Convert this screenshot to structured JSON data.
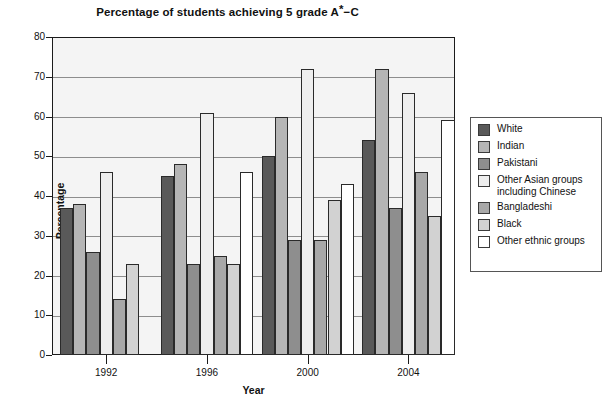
{
  "chart_data": {
    "type": "bar",
    "title": "Percentage of students achieving 5 grade A*−C",
    "title_prefix": "Percentage of students achieving 5 grade A",
    "title_star": "*",
    "title_suffix": "−C",
    "xlabel": "Year",
    "ylabel": "Percentage",
    "categories": [
      "1992",
      "1996",
      "2000",
      "2004"
    ],
    "ylim": [
      0,
      80
    ],
    "yticks": [
      0,
      10,
      20,
      30,
      40,
      50,
      60,
      70,
      80
    ],
    "grid": true,
    "legend_position": "right-outside",
    "series": [
      {
        "name": "White",
        "color": "#595959",
        "values": [
          37,
          45,
          50,
          54
        ]
      },
      {
        "name": "Indian",
        "color": "#b5b5b5",
        "values": [
          38,
          48,
          60,
          72
        ]
      },
      {
        "name": "Pakistani",
        "color": "#8e8e8e",
        "values": [
          26,
          23,
          29,
          37
        ]
      },
      {
        "name": "Other Asian groups\nincluding Chinese",
        "color": "#eeeeee",
        "values": [
          46,
          61,
          72,
          66
        ]
      },
      {
        "name": "Bangladeshi",
        "color": "#a8a8a8",
        "values": [
          14,
          25,
          29,
          46
        ]
      },
      {
        "name": "Black",
        "color": "#d2d2d2",
        "values": [
          23,
          23,
          39,
          35
        ]
      },
      {
        "name": "Other ethnic groups",
        "color": "#ffffff",
        "values": [
          null,
          46,
          43,
          59
        ]
      }
    ]
  }
}
